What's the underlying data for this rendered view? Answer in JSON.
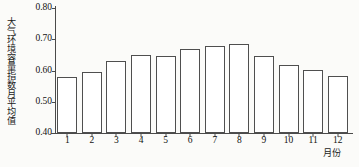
{
  "chart_data": {
    "type": "bar",
    "title": "",
    "subtitle": "",
    "xlabel": "月份",
    "ylabel": "大气环境容量指数月平均值",
    "categories": [
      "1",
      "2",
      "3",
      "4",
      "5",
      "6",
      "7",
      "8",
      "9",
      "10",
      "11",
      "12"
    ],
    "values": [
      0.58,
      0.595,
      0.63,
      0.651,
      0.647,
      0.668,
      0.68,
      0.686,
      0.645,
      0.618,
      0.602,
      0.583
    ],
    "series": [
      {
        "name": "大气环境容量指数月平均值",
        "values": [
          0.58,
          0.595,
          0.63,
          0.651,
          0.647,
          0.668,
          0.68,
          0.686,
          0.645,
          0.618,
          0.602,
          0.583
        ]
      }
    ],
    "ylim": [
      0.4,
      0.8
    ],
    "ytick_labels": [
      "0.40",
      "0.50",
      "0.60",
      "0.70",
      "0.80"
    ],
    "ytick_values": [
      0.4,
      0.5,
      0.6,
      0.7,
      0.8
    ],
    "grid": false,
    "legend": false,
    "legend_position": "none",
    "bar_fill_color": "#ffffff",
    "bar_edge_color": "#4f4f4f",
    "axis_color": "#4a4a4a",
    "background_color": "#fbfbf9"
  }
}
